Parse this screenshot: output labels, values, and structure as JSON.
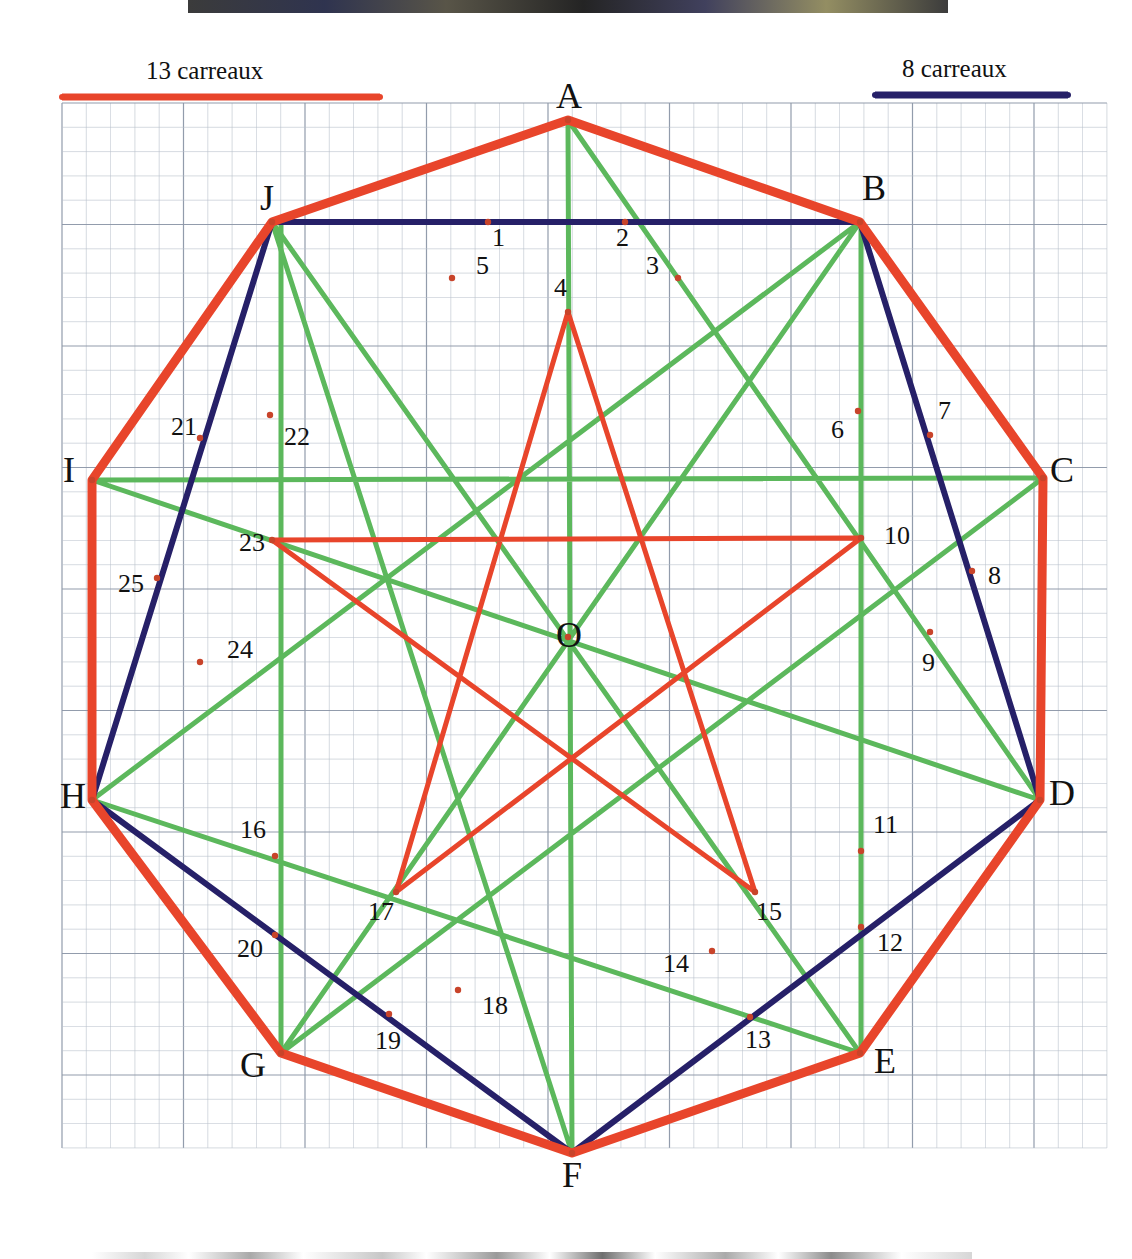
{
  "figure": {
    "title_center_label": "O",
    "grid": {
      "cell_px": 24.3,
      "origin_x": 62,
      "origin_y": 103,
      "cols": 43,
      "rows": 43,
      "minor_color": "#b9c0cc",
      "major_color": "#8d97a8"
    },
    "colors": {
      "red": "#E8452B",
      "navy": "#262068",
      "green": "#5CB85C",
      "dot": "#C8442A",
      "text": "#111111"
    }
  },
  "scales": [
    {
      "name": "red-scale",
      "label": "13 carreaux",
      "color": "#E8452B",
      "x1": 62,
      "x2": 380,
      "y": 97,
      "label_x": 146,
      "label_y": 57
    },
    {
      "name": "navy-scale",
      "label": "8 carreaux",
      "color": "#262068",
      "x1": 875,
      "x2": 1068,
      "y": 95,
      "label_x": 902,
      "label_y": 55
    }
  ],
  "vertices": [
    {
      "id": "A",
      "x": 568,
      "y": 120,
      "lx": 556,
      "ly": 78
    },
    {
      "id": "B",
      "x": 860,
      "y": 222,
      "lx": 862,
      "ly": 170
    },
    {
      "id": "C",
      "x": 1043,
      "y": 478,
      "lx": 1050,
      "ly": 452
    },
    {
      "id": "D",
      "x": 1040,
      "y": 800,
      "lx": 1049,
      "ly": 775
    },
    {
      "id": "E",
      "x": 860,
      "y": 1053,
      "lx": 874,
      "ly": 1043
    },
    {
      "id": "F",
      "x": 572,
      "y": 1153,
      "lx": 562,
      "ly": 1157
    },
    {
      "id": "G",
      "x": 281,
      "y": 1053,
      "lx": 240,
      "ly": 1047
    },
    {
      "id": "H",
      "x": 92,
      "y": 800,
      "lx": 60,
      "ly": 778
    },
    {
      "id": "I",
      "x": 92,
      "y": 480,
      "lx": 63,
      "ly": 452
    },
    {
      "id": "J",
      "x": 272,
      "y": 222,
      "lx": 260,
      "ly": 180
    }
  ],
  "marked_points": [
    {
      "n": "1",
      "x": 488,
      "y": 222,
      "lx": 492,
      "ly": 225
    },
    {
      "n": "2",
      "x": 625,
      "y": 222,
      "lx": 616,
      "ly": 225
    },
    {
      "n": "3",
      "x": 678,
      "y": 278,
      "lx": 646,
      "ly": 253
    },
    {
      "n": "4",
      "x": 568,
      "y": 312,
      "lx": 554,
      "ly": 275
    },
    {
      "n": "5",
      "x": 452,
      "y": 278,
      "lx": 476,
      "ly": 253
    },
    {
      "n": "6",
      "x": 858,
      "y": 411,
      "lx": 831,
      "ly": 417
    },
    {
      "n": "7",
      "x": 930,
      "y": 435,
      "lx": 938,
      "ly": 398
    },
    {
      "n": "8",
      "x": 972,
      "y": 571,
      "lx": 988,
      "ly": 563
    },
    {
      "n": "9",
      "x": 930,
      "y": 632,
      "lx": 922,
      "ly": 650
    },
    {
      "n": "10",
      "x": 861,
      "y": 538,
      "lx": 884,
      "ly": 523
    },
    {
      "n": "11",
      "x": 861,
      "y": 851,
      "lx": 873,
      "ly": 812
    },
    {
      "n": "12",
      "x": 861,
      "y": 927,
      "lx": 877,
      "ly": 930
    },
    {
      "n": "13",
      "x": 750,
      "y": 1017,
      "lx": 745,
      "ly": 1027
    },
    {
      "n": "14",
      "x": 712,
      "y": 951,
      "lx": 663,
      "ly": 951
    },
    {
      "n": "15",
      "x": 755,
      "y": 892,
      "lx": 756,
      "ly": 899
    },
    {
      "n": "16",
      "x": 275,
      "y": 856,
      "lx": 240,
      "ly": 817
    },
    {
      "n": "17",
      "x": 396,
      "y": 892,
      "lx": 368,
      "ly": 899
    },
    {
      "n": "18",
      "x": 458,
      "y": 990,
      "lx": 482,
      "ly": 993
    },
    {
      "n": "19",
      "x": 389,
      "y": 1014,
      "lx": 375,
      "ly": 1028
    },
    {
      "n": "20",
      "x": 275,
      "y": 935,
      "lx": 237,
      "ly": 936
    },
    {
      "n": "21",
      "x": 200,
      "y": 438,
      "lx": 171,
      "ly": 414
    },
    {
      "n": "22",
      "x": 270,
      "y": 415,
      "lx": 284,
      "ly": 424
    },
    {
      "n": "23",
      "x": 272,
      "y": 540,
      "lx": 239,
      "ly": 530
    },
    {
      "n": "24",
      "x": 200,
      "y": 662,
      "lx": 227,
      "ly": 637
    },
    {
      "n": "25",
      "x": 157,
      "y": 578,
      "lx": 118,
      "ly": 571
    }
  ],
  "paths": {
    "red_decagon": {
      "name": "red-outer-decagon",
      "vertices": [
        "A",
        "B",
        "C",
        "D",
        "E",
        "F",
        "G",
        "H",
        "I",
        "J"
      ],
      "closed": true,
      "width": 9
    },
    "red_pentagram": {
      "name": "red-inner-pentagram",
      "points": [
        {
          "x": 568,
          "y": 312
        },
        {
          "x": 755,
          "y": 892
        },
        {
          "x": 272,
          "y": 540
        },
        {
          "x": 861,
          "y": 538
        },
        {
          "x": 396,
          "y": 892
        }
      ],
      "closed": true,
      "width": 5
    },
    "navy_path": {
      "name": "navy-polygon",
      "points": [
        {
          "x": 272,
          "y": 222
        },
        {
          "x": 860,
          "y": 222
        },
        {
          "x": 1040,
          "y": 800
        },
        {
          "x": 572,
          "y": 1153
        },
        {
          "x": 92,
          "y": 800
        }
      ],
      "closed": true,
      "width": 6
    },
    "green_star": {
      "name": "green-star-polygon",
      "points": [
        {
          "x": 568,
          "y": 120
        },
        {
          "x": 1040,
          "y": 800
        },
        {
          "x": 92,
          "y": 480
        },
        {
          "x": 1043,
          "y": 478
        },
        {
          "x": 281,
          "y": 1053
        },
        {
          "x": 860,
          "y": 222
        },
        {
          "x": 92,
          "y": 800
        },
        {
          "x": 860,
          "y": 1053
        },
        {
          "x": 272,
          "y": 222
        },
        {
          "x": 572,
          "y": 1153
        }
      ],
      "closed": true,
      "width": 5
    },
    "green_verticals": [
      {
        "name": "green-vertical-left",
        "x": 281,
        "y1": 222,
        "y2": 1053
      },
      {
        "name": "green-vertical-right",
        "x": 861,
        "y1": 222,
        "y2": 1053
      }
    ]
  }
}
